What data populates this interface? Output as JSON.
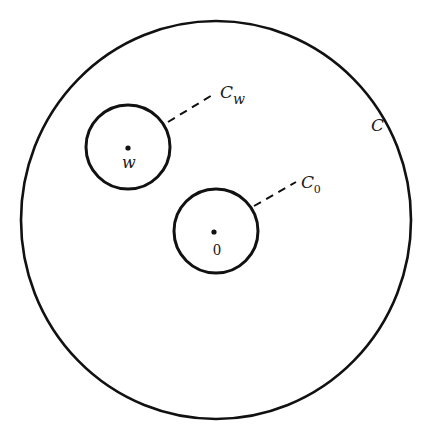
{
  "diagram": {
    "outer_circle": {
      "label": "C",
      "cx": 216,
      "cy": 220,
      "r": 197
    },
    "circle_w": {
      "label_main": "C",
      "label_sub": "w",
      "point_label": "w",
      "cx": 128,
      "cy": 148,
      "r": 42
    },
    "circle_0": {
      "label_main": "C",
      "label_sub": "0",
      "point_label": "0",
      "cx": 216,
      "cy": 232,
      "r": 42
    },
    "colors": {
      "stroke": "#111111",
      "background": "#ffffff"
    }
  }
}
